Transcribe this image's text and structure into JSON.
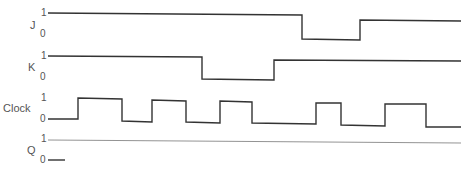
{
  "diagram": {
    "type": "timing-diagram",
    "signals": [
      {
        "name": "J",
        "levels": [
          "1",
          "0"
        ]
      },
      {
        "name": "K",
        "levels": [
          "1",
          "0"
        ]
      },
      {
        "name": "Clock",
        "levels": [
          "1",
          "0"
        ]
      },
      {
        "name": "Q",
        "levels": [
          "1",
          "0"
        ]
      }
    ],
    "waveforms": {
      "J": "48,13 302,15 302,39 360,40 360,20 461,21",
      "K": "48,56 202,57 202,79 274,80 274,60 461,61",
      "Clock": "48,119 78,119 78,98 122,99 122,121 152,122 152,100 186,101 186,122 220,123 220,101 252,102 252,123 316,124 316,103 341,103 341,125 385,126 385,104 426,104 426,127 461,127",
      "Q_ref": "48,140 461,143",
      "Q_start": "48,160 65,160"
    },
    "stroke_color": "#333333"
  }
}
